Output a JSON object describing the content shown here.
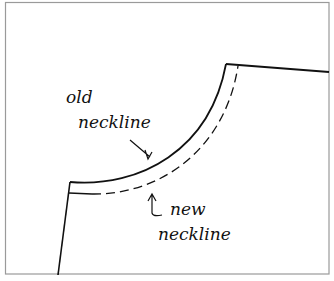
{
  "diagram": {
    "type": "sewing-pattern",
    "labels": {
      "old_neckline_line1": "old",
      "old_neckline_line2": "neckline",
      "new_neckline_line1": "new",
      "new_neckline_line2": "neckline"
    },
    "colors": {
      "stroke": "#111111",
      "frame": "#9a9a9a",
      "background": "#ffffff"
    }
  }
}
